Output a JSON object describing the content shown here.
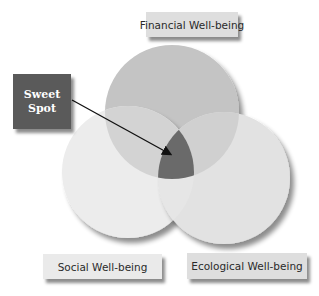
{
  "diagram": {
    "type": "venn",
    "sets": [
      {
        "label": "Financial Well-being",
        "position": "top"
      },
      {
        "label": "Social Well-being",
        "position": "bottom-left"
      },
      {
        "label": "Ecological Well-being",
        "position": "bottom-right"
      }
    ],
    "callout": {
      "line1": "Sweet",
      "line2": "Spot",
      "points_to": "center-intersection"
    },
    "colors": {
      "top_circle": "#c4c4c4",
      "left_circle": "#ececec",
      "right_circle": "#e2e2e2",
      "intersection": "#6a6a6a",
      "callout_box": "#5a5a5a",
      "label_box": "#dedede"
    }
  }
}
